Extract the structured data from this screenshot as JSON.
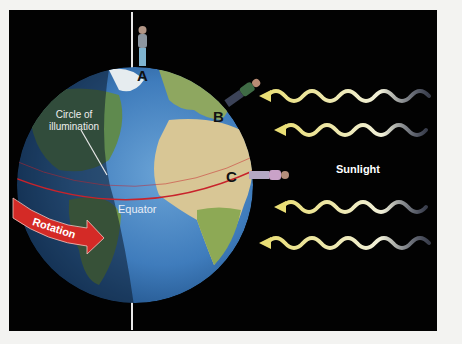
{
  "diagram": {
    "labels": {
      "circle_of_illumination_line1": "Circle of",
      "circle_of_illumination_line2": "illumination",
      "equator": "Equator",
      "rotation": "Rotation",
      "sunlight": "Sunlight",
      "point_a": "A",
      "point_b": "B",
      "point_c": "C"
    },
    "colors": {
      "background": "#020202",
      "page": "#f3f3f1",
      "ocean": "#3a78b8",
      "land_green": "#7d9b4a",
      "desert": "#d9c79a",
      "equator_line": "#c8232b",
      "rotation_arrow": "#d42a26",
      "sunlight_wave": "#e8e39a",
      "night_shade": "#0b1a2c"
    },
    "sunlight_arrows": 4,
    "observers": [
      {
        "label": "A",
        "position": "north pole"
      },
      {
        "label": "B",
        "position": "mid-latitude"
      },
      {
        "label": "C",
        "position": "equator"
      }
    ]
  }
}
